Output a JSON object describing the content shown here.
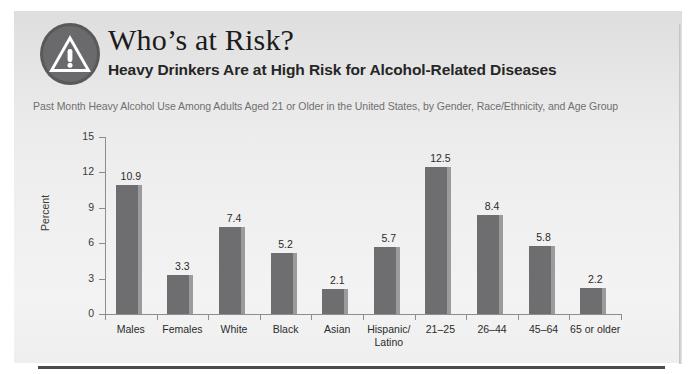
{
  "header": {
    "icon": "warning-triangle-icon",
    "title": "Who’s at Risk?",
    "subtitle": "Heavy Drinkers Are at High Risk for Alcohol-Related Diseases",
    "description": "Past Month Heavy Alcohol Use Among Adults Aged 21 or Older in the United States, by Gender, Race/Ethnicity, and Age Group"
  },
  "colors": {
    "panel_top": "#dedede",
    "panel_bottom": "#f1f1f1",
    "bar_fill": "#6e6e71",
    "bar_edge": "#9b9b9e",
    "axis": "#8d8d8d",
    "title_text": "#1b1b1b",
    "description_text": "#6f6f6f",
    "bottom_rule": "#4b4b4d"
  },
  "chart_data": {
    "type": "bar",
    "title": "Heavy Drinkers Are at High Risk for Alcohol-Related Diseases",
    "subtitle": "Past Month Heavy Alcohol Use Among Adults Aged 21 or Older in the United States, by Gender, Race/Ethnicity, and Age Group",
    "xlabel": "",
    "ylabel": "Percent",
    "categories": [
      "Males",
      "Females",
      "White",
      "Black",
      "Asian",
      "Hispanic/\nLatino",
      "21–25",
      "26–44",
      "45–64",
      "65 or older"
    ],
    "category_lines": [
      [
        "Males"
      ],
      [
        "Females"
      ],
      [
        "White"
      ],
      [
        "Black"
      ],
      [
        "Asian"
      ],
      [
        "Hispanic/",
        "Latino"
      ],
      [
        "21–25"
      ],
      [
        "26–44"
      ],
      [
        "45–64"
      ],
      [
        "65 or older"
      ]
    ],
    "values": [
      10.9,
      3.3,
      7.4,
      5.2,
      2.1,
      5.7,
      12.5,
      8.4,
      5.8,
      2.2
    ],
    "value_labels": [
      "10.9",
      "3.3",
      "7.4",
      "5.2",
      "2.1",
      "5.7",
      "12.5",
      "8.4",
      "5.8",
      "2.2"
    ],
    "ylim": [
      0,
      15
    ],
    "yticks": [
      0,
      3,
      6,
      9,
      12,
      15
    ],
    "ytick_labels": [
      "0",
      "3",
      "6",
      "9",
      "12",
      "15"
    ],
    "grid": false,
    "legend": null
  }
}
